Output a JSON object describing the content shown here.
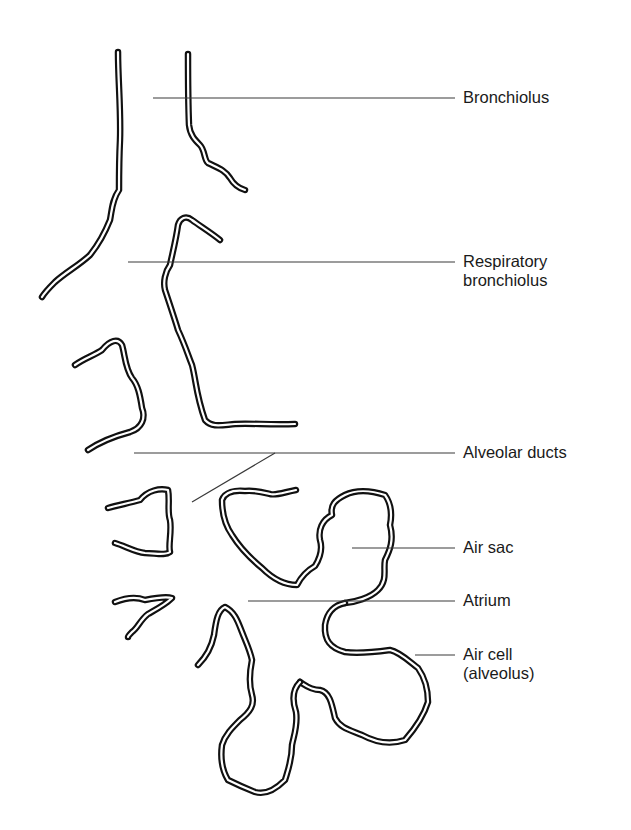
{
  "diagram": {
    "labels": [
      {
        "id": "bronchiolus",
        "text": "Bronchiolus",
        "lines": [
          "Bronchiolus"
        ]
      },
      {
        "id": "respiratory-bronchiolus",
        "text": "Respiratory bronchiolus",
        "lines": [
          "Respiratory",
          "bronchiolus"
        ]
      },
      {
        "id": "alveolar-ducts",
        "text": "Alveolar ducts",
        "lines": [
          "Alveolar ducts"
        ]
      },
      {
        "id": "air-sac",
        "text": "Air sac",
        "lines": [
          "Air sac"
        ]
      },
      {
        "id": "atrium",
        "text": "Atrium",
        "lines": [
          "Atrium"
        ]
      },
      {
        "id": "air-cell",
        "text": "Air cell (alveolus)",
        "lines": [
          "Air cell",
          "(alveolus)"
        ]
      }
    ],
    "colors": {
      "background": "#ffffff",
      "wall": "#111111",
      "leader_line": "#3a3a3a",
      "text": "#1a1a1a"
    }
  }
}
